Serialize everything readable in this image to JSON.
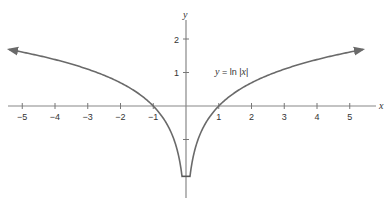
{
  "chart_data": {
    "type": "line",
    "title": "",
    "xlabel": "x",
    "ylabel": "y",
    "xlim": [
      -5.5,
      5.6
    ],
    "ylim": [
      -2.2,
      2.5
    ],
    "grid": false,
    "legend": null,
    "x_ticks": [
      -5,
      -4,
      -3,
      -2,
      -1,
      1,
      2,
      3,
      4,
      5
    ],
    "x_tick_labels": [
      "−5",
      "−4",
      "−3",
      "−2",
      "−1",
      "1",
      "2",
      "3",
      "4",
      "5"
    ],
    "y_ticks": [
      2,
      1,
      -1
    ],
    "y_tick_labels": [
      "2",
      "1",
      ""
    ],
    "annotations": [
      {
        "text": "y = ln |x|",
        "x": 1.6,
        "y": 1.0
      }
    ],
    "series": [
      {
        "name": "y = ln |x|",
        "function": "ln|x|",
        "branches": [
          {
            "x": [
              -5.4,
              -5,
              -4,
              -3,
              -2,
              -1.5,
              -1,
              -0.7,
              -0.5,
              -0.3,
              -0.2,
              -0.12
            ],
            "y": [
              1.69,
              1.61,
              1.39,
              1.1,
              0.69,
              0.41,
              0.0,
              -0.36,
              -0.69,
              -1.2,
              -1.61,
              -2.1
            ]
          },
          {
            "x": [
              0.12,
              0.2,
              0.3,
              0.5,
              0.7,
              1,
              1.5,
              2,
              3,
              4,
              5,
              5.4
            ],
            "y": [
              -2.1,
              -1.61,
              -1.2,
              -0.69,
              -0.36,
              0.0,
              0.41,
              0.69,
              1.1,
              1.39,
              1.61,
              1.69
            ]
          }
        ],
        "arrows": [
          "left-end",
          "right-end"
        ],
        "color": "#666666"
      }
    ]
  },
  "labels": {
    "x_axis": "x",
    "y_axis": "y",
    "equation_y": "y",
    "equation_eq": " = ln |",
    "equation_x": "x",
    "equation_end": "|"
  },
  "colors": {
    "axis": "#777777",
    "curve": "#6a6a6a",
    "text": "#333333"
  }
}
